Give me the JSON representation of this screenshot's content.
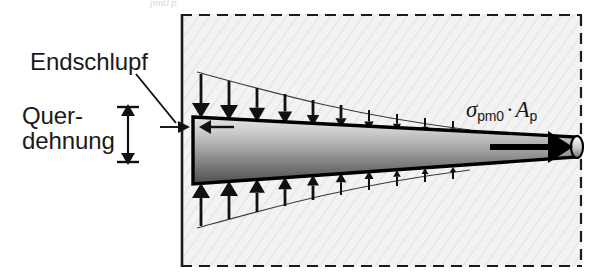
{
  "figure": {
    "kind": "engineering-diagram",
    "background_color": "#ffffff",
    "panel_fill": "#f2f2f2",
    "panel_border_color": "#1a1a1a",
    "tendon_outline_color": "#000000",
    "tendon_gradient_light": "#dcdcdc",
    "tendon_gradient_dark": "#4a4a4a",
    "arrow_color": "#111111"
  },
  "labels": {
    "endschlupf": "Endschlupf",
    "quer_line1": "Quer-",
    "quer_line2": "dehnung",
    "top_clipped": "pm0  p"
  },
  "formula": {
    "sigma": "σ",
    "sigma_sub": "pm0",
    "dot": "·",
    "area": "A",
    "area_sub": "p",
    "plain": "σpm0 · Ap"
  },
  "panel": {
    "x": 181,
    "y": 14,
    "width": 401,
    "height": 253,
    "left_edge_style": "solid",
    "top_edge_style": "dashed",
    "right_edge_style": "dashed",
    "bottom_edge_style": "dashed"
  },
  "tendon": {
    "left_x": 192,
    "right_x": 578,
    "left_top_y": 116,
    "left_bottom_y": 185,
    "right_top_y": 136,
    "right_bottom_y": 158,
    "end_cap": "ellipse",
    "end_cap_cx": 578,
    "end_cap_ry": 11
  },
  "force_arrow": {
    "name": "prestress-force-arrow",
    "x_start": 490,
    "x_end": 566,
    "y": 147,
    "direction": "right"
  },
  "slip_arrow": {
    "name": "end-slip-arrow",
    "x_start": 232,
    "x_end": 203,
    "y": 127,
    "direction": "left"
  },
  "leader": {
    "name": "endschlupf-leader",
    "from_x": 136,
    "from_y": 74,
    "to_x": 192,
    "to_y": 127
  },
  "dimension": {
    "name": "transverse-strain-dimension",
    "x": 128,
    "top_y": 107,
    "bottom_y": 162,
    "cap_half_width": 11,
    "double_headed": true
  },
  "bond_stress": {
    "note": "Bond stress distribution arrows, decaying from the tendon end",
    "top_arrow_count": 10,
    "bottom_arrow_count": 10,
    "top_direction": "down",
    "bottom_direction": "up",
    "envelope": "exponential-decay",
    "arrow_x": [
      201,
      229,
      257,
      285,
      313,
      341,
      369,
      397,
      425,
      453
    ],
    "top_tail_y": [
      74,
      81,
      88,
      94,
      100,
      105,
      110,
      114,
      118,
      121
    ],
    "top_tip_y": [
      118,
      120,
      122,
      124,
      126,
      128,
      130,
      131,
      133,
      134
    ],
    "bottom_tail_y": [
      226,
      219,
      212,
      206,
      200,
      195,
      190,
      186,
      182,
      179
    ],
    "bottom_tip_y": [
      183,
      181,
      179,
      177,
      175,
      173,
      171,
      170,
      168,
      167
    ]
  }
}
